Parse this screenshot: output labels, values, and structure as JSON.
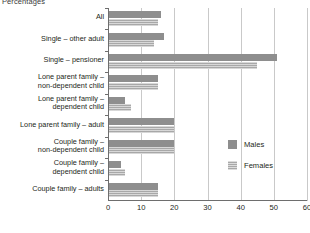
{
  "chart_data": {
    "type": "bar",
    "orientation": "horizontal",
    "title": "Percentages",
    "xlabel": "",
    "ylabel": "",
    "xlim": [
      0,
      60
    ],
    "xticks": [
      0,
      10,
      20,
      30,
      40,
      50,
      60
    ],
    "grid": true,
    "legend_position": "right",
    "categories": [
      "All",
      "Single – other adult",
      "Single – pensioner",
      "Lone parent family –\nnon-dependent child",
      "Lone parent family –\ndependent child",
      "Lone parent family – adult",
      "Couple family –\nnon-dependent child",
      "Couple family –\ndependent child",
      "Couple family – adults"
    ],
    "series": [
      {
        "name": "Males",
        "color": "#8e8e8e",
        "values": [
          16,
          17,
          51,
          15,
          5,
          20,
          20,
          4,
          15
        ]
      },
      {
        "name": "Females",
        "color": "#a8a8a8",
        "values": [
          15,
          14,
          45,
          15,
          7,
          20,
          20,
          5,
          15
        ]
      }
    ]
  },
  "legend": {
    "items": [
      {
        "label": "Males"
      },
      {
        "label": "Females"
      }
    ]
  }
}
